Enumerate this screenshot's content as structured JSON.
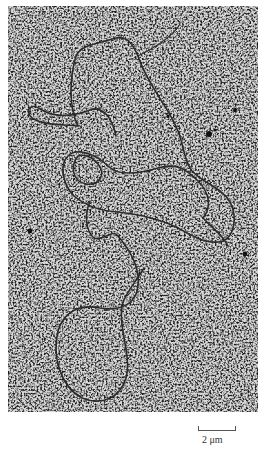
{
  "figure": {
    "type": "electron micrograph",
    "background_color": "#a9a9a9",
    "strand_color": "#2a2a2a"
  },
  "scale_bar": {
    "label": "2 μm",
    "length_px": 36
  }
}
